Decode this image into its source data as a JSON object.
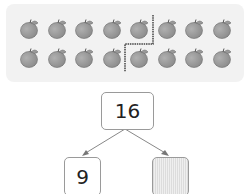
{
  "apples": {
    "rows": 2,
    "per_row": 8,
    "total": 16,
    "icon": "apple-icon",
    "color": "#8a8a8a"
  },
  "divider": {
    "left_group_count": 9,
    "right_group_count": 7
  },
  "number_bond": {
    "whole": "16",
    "part_left": "9",
    "part_right": ""
  }
}
